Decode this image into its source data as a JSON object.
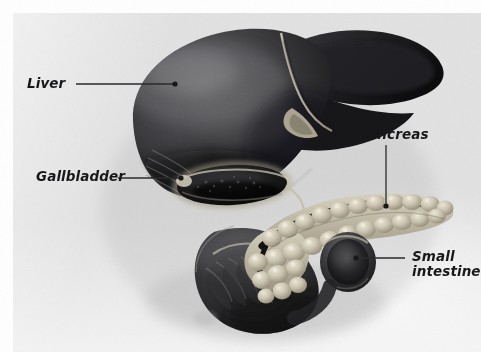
{
  "figure": {
    "kind": "anatomical-illustration",
    "background_color": "#e2e2e2",
    "page_color": "#ffffff",
    "ink_color": "#17181a",
    "leader_color": "#2a2a2c"
  },
  "labels": [
    {
      "id": "liver",
      "text": "Liver",
      "lines": [
        "Liver"
      ],
      "leader": {
        "x1": 76,
        "y1": 84,
        "x2": 174,
        "y2": 84,
        "dot": true
      }
    },
    {
      "id": "gallbladder",
      "text": "Gallbladder",
      "lines": [
        "Gallbladder"
      ],
      "leader": {
        "x1": 118,
        "y1": 178,
        "x2": 180,
        "y2": 178,
        "dot": true
      }
    },
    {
      "id": "pancreas",
      "text": "Pancreas",
      "lines": [
        "Pancreas"
      ],
      "leader": {
        "x1": 386,
        "y1": 145,
        "x2": 386,
        "y2": 205,
        "dot": true
      }
    },
    {
      "id": "small-intestine",
      "text": "Small intestine",
      "lines": [
        "Small",
        "intestine"
      ],
      "leader": {
        "x1": 405,
        "y1": 258,
        "x2": 357,
        "y2": 258,
        "dot": true
      }
    }
  ],
  "organs": [
    {
      "id": "liver",
      "name": "Liver",
      "tone": "#2b2b2d",
      "note": "large dark lobed mass, upper portion of plate"
    },
    {
      "id": "falciform-ligament",
      "name": "Falciform ligament",
      "tone": "#cfc6b4",
      "note": "pale ridge dividing right and left lobes"
    },
    {
      "id": "gallbladder",
      "name": "Gallbladder",
      "tone": "#1b1b1c",
      "note": "dark oval sac under the liver"
    },
    {
      "id": "pancreas",
      "name": "Pancreas",
      "tone": "#c9c2ab",
      "note": "lobulated pale gland running to the right"
    },
    {
      "id": "pancreatic-duct",
      "name": "Pancreatic duct",
      "tone": "#171717",
      "note": "dark channel along the gland"
    },
    {
      "id": "duodenum",
      "name": "Duodenum",
      "tone": "#343436",
      "note": "C-shaped loop around the pancreas head"
    },
    {
      "id": "small-intestine",
      "name": "Small intestine",
      "tone": "#2e2e30",
      "note": "cut tubular end at lower right"
    }
  ]
}
